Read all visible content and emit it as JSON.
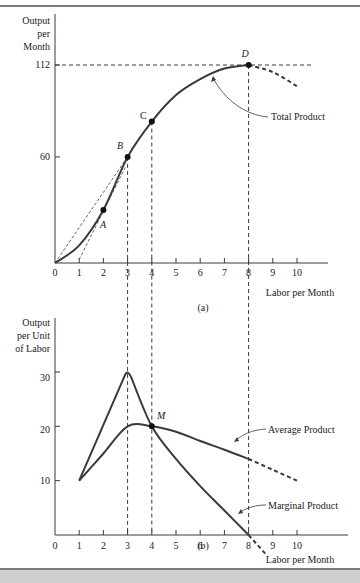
{
  "chart_data": [
    {
      "type": "line",
      "panel_label": "(a)",
      "title": "",
      "ylabel": "Output per Month",
      "xlabel": "Labor per Month",
      "xlim": [
        0,
        10
      ],
      "ylim": [
        0,
        112
      ],
      "x_ticks": [
        0,
        1,
        2,
        3,
        4,
        5,
        6,
        7,
        8,
        9,
        10
      ],
      "y_ticks": [
        60,
        112
      ],
      "grid": false,
      "series": [
        {
          "name": "Total Product",
          "x": [
            0,
            1,
            2,
            3,
            4,
            5,
            6,
            7,
            8,
            9,
            10
          ],
          "y": [
            0,
            10,
            30,
            60,
            80,
            95,
            104,
            110,
            112,
            108,
            100
          ],
          "solid_until_x": 8,
          "dashed_after_x": 8
        }
      ],
      "points": [
        {
          "label": "A",
          "x": 2,
          "y": 30
        },
        {
          "label": "B",
          "x": 3,
          "y": 60
        },
        {
          "label": "C",
          "x": 4,
          "y": 80
        },
        {
          "label": "D",
          "x": 8,
          "y": 112
        }
      ],
      "reference_lines": [
        {
          "type": "horizontal",
          "y": 112,
          "style": "dashed"
        },
        {
          "type": "vertical",
          "x": 3,
          "style": "dashed"
        },
        {
          "type": "vertical",
          "x": 4,
          "style": "dashed"
        },
        {
          "type": "vertical",
          "x": 8,
          "style": "dashed"
        },
        {
          "type": "ray",
          "from": [
            0,
            0
          ],
          "to": [
            3,
            60
          ],
          "style": "dashed"
        },
        {
          "type": "tangent",
          "at": [
            2,
            30
          ],
          "style": "dashed"
        }
      ],
      "annotations": [
        {
          "text": "Total Product",
          "points_to_x": 7
        }
      ]
    },
    {
      "type": "line",
      "panel_label": "(b)",
      "title": "",
      "ylabel": "Output per Unit of Labor",
      "xlabel": "Labor per Month",
      "xlim": [
        0,
        10
      ],
      "ylim": [
        0,
        30
      ],
      "x_ticks": [
        0,
        1,
        2,
        3,
        4,
        5,
        6,
        7,
        8,
        9,
        10
      ],
      "y_ticks": [
        10,
        20,
        30
      ],
      "grid": false,
      "series": [
        {
          "name": "Average Product",
          "x": [
            1,
            2,
            3,
            4,
            5,
            6,
            7,
            8,
            9,
            10
          ],
          "y": [
            10,
            15,
            20,
            20,
            19,
            17.3,
            15.7,
            14,
            12,
            10
          ],
          "dashed_after_x": 8
        },
        {
          "name": "Marginal Product",
          "x": [
            1,
            2,
            3,
            4,
            5,
            6,
            7,
            8,
            9
          ],
          "y": [
            10,
            20,
            30,
            20,
            15,
            9,
            5,
            0,
            -4
          ],
          "dashed_after_x": 8
        }
      ],
      "points": [
        {
          "label": "M",
          "x": 4,
          "y": 20
        }
      ],
      "reference_lines": [
        {
          "type": "vertical",
          "x": 3,
          "style": "dashed"
        },
        {
          "type": "vertical",
          "x": 4,
          "style": "dashed"
        },
        {
          "type": "vertical",
          "x": 8,
          "style": "dashed"
        }
      ],
      "annotations": [
        {
          "text": "Average Product",
          "points_to_x": 7
        },
        {
          "text": "Marginal Product",
          "points_to_x": 7
        }
      ]
    }
  ],
  "labels": {
    "a_ylabel": [
      "Output",
      "per",
      "Month"
    ],
    "b_ylabel": [
      "Output",
      "per Unit",
      "of Labor"
    ],
    "xlabel": "Labor per Month",
    "panel_a": "(a)",
    "panel_b": "(b)",
    "tp": "Total Product",
    "ap": "Average Product",
    "mp": "Marginal Product",
    "A": "A",
    "B": "B",
    "C": "C",
    "D": "D",
    "M": "M",
    "y112": "112",
    "y60": "60",
    "y30": "30",
    "y20": "20",
    "y10": "10",
    "x_ticks": [
      "0",
      "1",
      "2",
      "3",
      "4",
      "5",
      "6",
      "7",
      "8",
      "9",
      "10"
    ]
  }
}
